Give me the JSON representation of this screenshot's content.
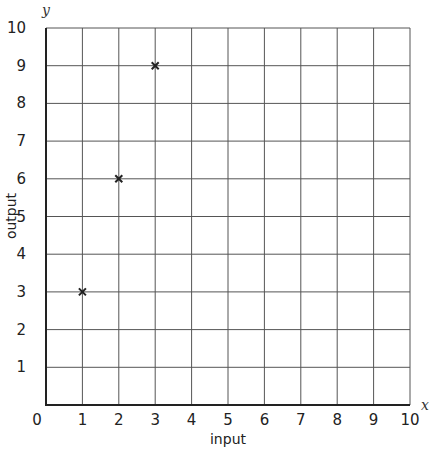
{
  "chart_data": {
    "type": "scatter",
    "title": "",
    "xlabel": "input",
    "ylabel": "output",
    "x_axis_variable": "x",
    "y_axis_variable": "y",
    "xlim": [
      0,
      10
    ],
    "ylim": [
      0,
      10
    ],
    "x_ticks": [
      "0",
      "1",
      "2",
      "3",
      "4",
      "5",
      "6",
      "7",
      "8",
      "9",
      "10"
    ],
    "y_ticks": [
      "1",
      "2",
      "3",
      "4",
      "5",
      "6",
      "7",
      "8",
      "9",
      "10"
    ],
    "grid": true,
    "marker": "x",
    "series": [
      {
        "name": "points",
        "x": [
          1,
          2,
          3
        ],
        "y": [
          3,
          6,
          9
        ]
      }
    ]
  },
  "colors": {
    "grid": "#555555",
    "axis": "#222222",
    "marker": "#222222",
    "background": "#ffffff"
  }
}
